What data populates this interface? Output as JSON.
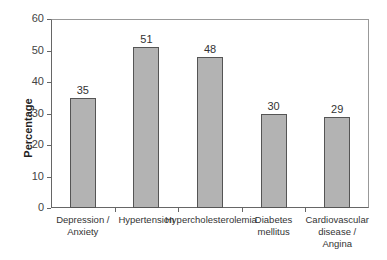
{
  "chart_data": {
    "type": "bar",
    "title": "",
    "xlabel": "",
    "ylabel": "Percentage",
    "ylim": [
      0,
      60
    ],
    "yticks": [
      0,
      10,
      20,
      30,
      40,
      50,
      60
    ],
    "categories": [
      "Depression / Anxiety",
      "Hypertension",
      "Hypercholesterolemia",
      "Diabetes mellitus",
      "Cardiovascular disease / Angina"
    ],
    "category_lines": [
      [
        "Depression /",
        "Anxiety"
      ],
      [
        "Hypertension"
      ],
      [
        "Hypercholesterolemia"
      ],
      [
        "Diabetes",
        "mellitus"
      ],
      [
        "Cardiovascular",
        "disease /",
        "Angina"
      ]
    ],
    "values": [
      35,
      51,
      48,
      30,
      29
    ],
    "data_labels": [
      "35",
      "51",
      "48",
      "30",
      "29"
    ],
    "grid": false,
    "legend": null,
    "bar_color": "#b3b3b3"
  }
}
